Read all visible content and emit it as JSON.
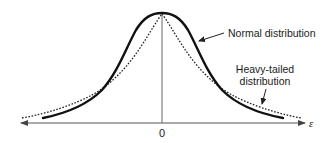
{
  "figure": {
    "type": "probability-density-comparison",
    "axis": {
      "x_variable": "ε",
      "origin_tick": "0"
    },
    "curves": [
      {
        "name": "normal",
        "label": "Normal distribution",
        "style": "solid-thick",
        "color": "#111111"
      },
      {
        "name": "heavy-tailed",
        "label_line1": "Heavy-tailed",
        "label_line2": "distribution",
        "style": "dotted",
        "color": "#222222"
      }
    ],
    "colors": {
      "background": "#ffffff",
      "ink": "#111111",
      "axis": "#555555"
    }
  }
}
